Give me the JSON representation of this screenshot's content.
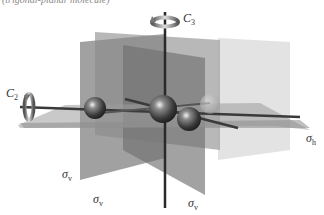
{
  "caption": "(trigonal-planar molecule)",
  "molecule": {
    "point_group": "D3h",
    "central_atom": {
      "x": 163,
      "y": 108,
      "r": 13
    },
    "ligands": [
      {
        "x": 90,
        "y": 110,
        "r": 11
      },
      {
        "x": 191,
        "y": 119,
        "r": 12
      },
      {
        "x": 210,
        "y": 106,
        "r": 10
      }
    ]
  },
  "labels": {
    "c3": {
      "symbol": "C",
      "sub": "3"
    },
    "c2": {
      "symbol": "C",
      "sub": "2"
    },
    "sigma_h": {
      "symbol": "σ",
      "sub": "h"
    },
    "sigma_v1": {
      "symbol": "σ",
      "sub": "v"
    },
    "sigma_v2": {
      "symbol": "σ",
      "sub": "v"
    },
    "sigma_v3": {
      "symbol": "σ",
      "sub": "v"
    }
  },
  "colors": {
    "plane_dark": "#7a7a7a",
    "plane_mid": "#9a9a9a",
    "plane_light": "#c8c8c8",
    "axis": "#2a2a2a",
    "atom": "#3a3a3a"
  }
}
